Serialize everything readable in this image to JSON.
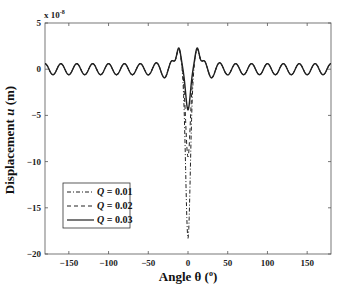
{
  "chart_data": {
    "type": "line",
    "title": "",
    "xlabel": "Angle θ (°)",
    "ylabel": "Displacement u (m)",
    "y_multiplier": "x 10^-8",
    "xlim": [
      -180,
      180
    ],
    "ylim": [
      -20,
      5
    ],
    "x_ticks": [
      -150,
      -100,
      -50,
      0,
      50,
      100,
      150
    ],
    "y_ticks": [
      5,
      0,
      -5,
      -10,
      -15,
      -20
    ],
    "grid": false,
    "legend_position": "lower left",
    "series": [
      {
        "name": "Q = 0.01",
        "style": "dash-dot",
        "min_value": -18.3,
        "min_at": 0,
        "side_peaks": 3.5,
        "side_peak_at": [
          -12,
          12
        ],
        "far_field_amplitude": 0.6,
        "period_deg": 20
      },
      {
        "name": "Q = 0.02",
        "style": "dashed",
        "min_value": -9.5,
        "min_at": 0,
        "side_peaks": 3.5,
        "side_peak_at": [
          -12,
          12
        ],
        "far_field_amplitude": 0.6,
        "period_deg": 20
      },
      {
        "name": "Q = 0.03",
        "style": "solid",
        "min_value": -4.4,
        "min_at": 0,
        "side_peaks": 3.6,
        "side_peak_at": [
          -12,
          12
        ],
        "far_field_amplitude": 0.6,
        "period_deg": 20
      }
    ]
  },
  "axes": {
    "multiplier_label": "x 10",
    "multiplier_exp": "-8",
    "x_tick_labels": [
      "−150",
      "−100",
      "−50",
      "0",
      "50",
      "100",
      "150"
    ],
    "y_tick_labels": [
      "5",
      "0",
      "−5",
      "−10",
      "−15",
      "−20"
    ],
    "xlabel_text": "Angle θ (",
    "xlabel_sup": "o",
    "xlabel_close": ")",
    "ylabel_prefix": "Displacement ",
    "ylabel_var": "u",
    "ylabel_unit": " (m)"
  },
  "legend": {
    "items": [
      {
        "var": "Q",
        "text": " = 0.01"
      },
      {
        "var": "Q",
        "text": " = 0.02"
      },
      {
        "var": "Q",
        "text": " = 0.03"
      }
    ]
  }
}
